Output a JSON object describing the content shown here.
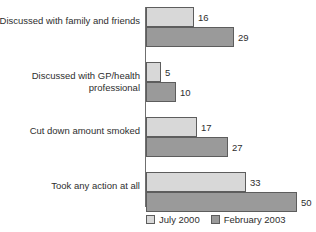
{
  "chart_data": {
    "type": "bar",
    "orientation": "horizontal",
    "title": "",
    "subtitle": "",
    "xlabel": "",
    "ylabel": "",
    "grid": false,
    "legend_position": "bottom-right",
    "xlim": [
      0,
      50
    ],
    "categories": [
      "Discussed with family and friends",
      "Discussed with GP/health\nprofessional",
      "Cut down amount smoked",
      "Took any action at all"
    ],
    "series": [
      {
        "name": "July 2000",
        "color": "#d8d8d8",
        "values": [
          16,
          5,
          17,
          33
        ]
      },
      {
        "name": "February 2003",
        "color": "#9a9a9a",
        "values": [
          29,
          10,
          27,
          50
        ]
      }
    ],
    "value_labels": [
      [
        "16",
        "29"
      ],
      [
        "5",
        "10"
      ],
      [
        "17",
        "27"
      ],
      [
        "33",
        "50"
      ]
    ]
  },
  "legend": {
    "items": [
      {
        "label": "July 2000",
        "swatch": "light-gray-swatch"
      },
      {
        "label": "February 2003",
        "swatch": "dark-gray-swatch"
      }
    ]
  }
}
